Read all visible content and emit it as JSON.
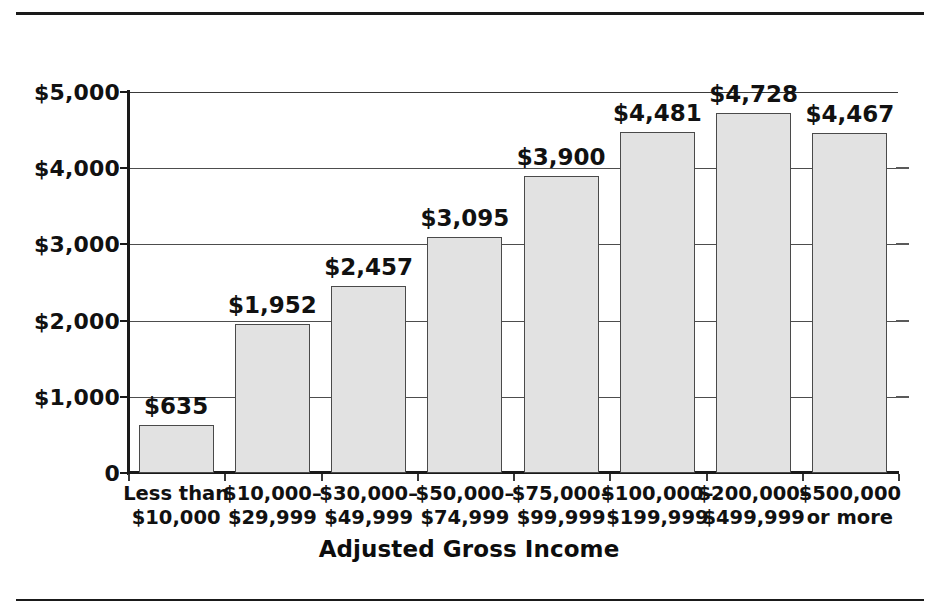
{
  "chart_data": {
    "type": "bar",
    "title": "",
    "xlabel": "Adjusted Gross Income",
    "ylabel": "",
    "grid": true,
    "legend": false,
    "ylim": [
      0,
      5000
    ],
    "yticks": [
      0,
      1000,
      2000,
      3000,
      4000,
      5000
    ],
    "ytick_labels": [
      "0",
      "$1,000",
      "$2,000",
      "$3,000",
      "$4,000",
      "$5,000"
    ],
    "categories": [
      "Less than $10,000",
      "$10,000–$29,999",
      "$30,000–$49,999",
      "$50,000–$74,999",
      "$75,000–$99,999",
      "$100,000–$199,999",
      "$200,000–$499,999",
      "$500,000 or more"
    ],
    "category_lines": [
      {
        "line1": "Less than",
        "line2": "$10,000"
      },
      {
        "line1": "$10,000–",
        "line2": "$29,999"
      },
      {
        "line1": "$30,000–",
        "line2": "$49,999"
      },
      {
        "line1": "$50,000–",
        "line2": "$74,999"
      },
      {
        "line1": "$75,000–",
        "line2": "$99,999"
      },
      {
        "line1": "$100,000–",
        "line2": "$199,999"
      },
      {
        "line1": "$200,000–",
        "line2": "$499,999"
      },
      {
        "line1": "$500,000",
        "line2": "or more"
      }
    ],
    "values": [
      635,
      1952,
      2457,
      3095,
      3900,
      4481,
      4728,
      4467
    ],
    "value_labels": [
      "$635",
      "$1,952",
      "$2,457",
      "$3,095",
      "$3,900",
      "$4,481",
      "$4,728",
      "$4,467"
    ],
    "bar_fill": "#e2e2e2",
    "bar_stroke": "#4a4a4a",
    "text_color": "#111111"
  }
}
